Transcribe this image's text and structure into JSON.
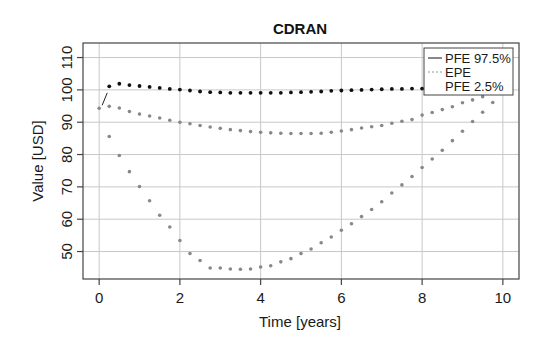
{
  "chart_data": {
    "type": "scatter",
    "title": "CDRAN",
    "xlabel": "Time [years]",
    "ylabel": "Value [USD]",
    "xlim": [
      -0.4,
      10.4
    ],
    "ylim": [
      41.5,
      114.5
    ],
    "xticks": [
      0,
      2,
      4,
      6,
      8,
      10
    ],
    "xtick_labels": [
      "0",
      "2",
      "4",
      "6",
      "8",
      "10"
    ],
    "yticks": [
      50,
      60,
      70,
      80,
      90,
      100,
      110
    ],
    "ytick_labels": [
      "50",
      "60",
      "70",
      "80",
      "90",
      "100",
      "110"
    ],
    "grid": true,
    "legend": {
      "position": "top-right",
      "entries": [
        {
          "label": "PFE 97.5%",
          "style": "solid"
        },
        {
          "label": "EPE",
          "style": "dotted"
        },
        {
          "label": "PFE 2.5%",
          "style": "none"
        }
      ]
    },
    "series": [
      {
        "name": "PFE 97.5%",
        "color": "#111111",
        "x": [
          0.25,
          0.5,
          0.75,
          1.0,
          1.25,
          1.5,
          1.75,
          2.0,
          2.25,
          2.5,
          2.75,
          3.0,
          3.25,
          3.5,
          3.75,
          4.0,
          4.25,
          4.5,
          4.75,
          5.0,
          5.25,
          5.5,
          5.75,
          6.0,
          6.25,
          6.5,
          6.75,
          7.0,
          7.25,
          7.5,
          7.75,
          8.0
        ],
        "y": [
          101.1,
          101.9,
          101.5,
          101.2,
          100.9,
          100.6,
          100.3,
          100.1,
          99.8,
          99.5,
          99.3,
          99.2,
          99.1,
          99.1,
          99.1,
          99.1,
          99.1,
          99.1,
          99.2,
          99.3,
          99.4,
          99.5,
          99.7,
          99.8,
          99.9,
          100.0,
          100.1,
          100.2,
          100.3,
          100.3,
          100.4,
          100.4
        ]
      },
      {
        "name": "EPE",
        "color": "#888888",
        "x": [
          0.0,
          0.25,
          0.5,
          0.75,
          1.0,
          1.25,
          1.5,
          1.75,
          2.0,
          2.25,
          2.5,
          2.75,
          3.0,
          3.25,
          3.5,
          3.75,
          4.0,
          4.25,
          4.5,
          4.75,
          5.0,
          5.25,
          5.5,
          5.75,
          6.0,
          6.25,
          6.5,
          6.75,
          7.0,
          7.25,
          7.5,
          7.75,
          8.0,
          8.25,
          8.5,
          8.75,
          9.0,
          9.25,
          9.5
        ],
        "y": [
          94.3,
          94.9,
          94.4,
          93.3,
          92.5,
          91.9,
          91.3,
          90.6,
          90.0,
          89.5,
          89.0,
          88.5,
          88.1,
          87.7,
          87.4,
          87.1,
          86.9,
          86.7,
          86.6,
          86.5,
          86.5,
          86.5,
          86.6,
          86.9,
          87.3,
          87.7,
          88.2,
          88.6,
          89.0,
          89.7,
          90.3,
          90.8,
          92.2,
          93.0,
          93.9,
          94.8,
          96.0,
          96.9,
          97.9
        ]
      },
      {
        "name": "PFE 2.5%",
        "color": "#888888",
        "x": [
          0.25,
          0.5,
          0.75,
          1.0,
          1.25,
          1.5,
          1.75,
          2.0,
          2.25,
          2.5,
          2.75,
          3.0,
          3.25,
          3.5,
          3.75,
          4.0,
          4.25,
          4.5,
          4.75,
          5.0,
          5.25,
          5.5,
          5.75,
          6.0,
          6.25,
          6.5,
          6.75,
          7.0,
          7.25,
          7.5,
          7.75,
          8.0,
          8.25,
          8.5,
          8.75,
          9.0,
          9.25,
          9.5,
          9.75
        ],
        "y": [
          85.6,
          79.7,
          74.7,
          70.1,
          65.7,
          61.2,
          57.6,
          53.4,
          49.4,
          47.2,
          44.9,
          44.9,
          44.6,
          44.5,
          44.6,
          45.2,
          45.6,
          46.8,
          47.8,
          49.4,
          50.8,
          52.7,
          54.5,
          56.6,
          58.6,
          60.8,
          63.0,
          65.4,
          68.1,
          70.6,
          73.2,
          76.0,
          78.6,
          81.3,
          84.3,
          87.2,
          90.2,
          93.1,
          96.1
        ]
      }
    ],
    "initial_segment": {
      "x": [
        0.0,
        0.25
      ],
      "y": [
        94.3,
        100.0
      ]
    }
  }
}
